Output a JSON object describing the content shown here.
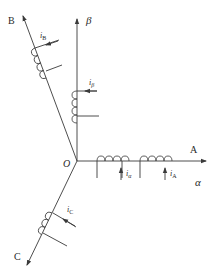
{
  "diagram": {
    "title": "",
    "origin_label": "O",
    "axes": {
      "A": {
        "label": "A"
      },
      "B": {
        "label": "B"
      },
      "C": {
        "label": "C"
      },
      "alpha": {
        "label": "α"
      },
      "beta": {
        "label": "β"
      }
    },
    "currents": {
      "iA": {
        "main": "i",
        "sub": "A"
      },
      "iB": {
        "main": "i",
        "sub": "B"
      },
      "iC": {
        "main": "i",
        "sub": "C"
      },
      "ialpha": {
        "main": "i",
        "sub": "α"
      },
      "ibeta": {
        "main": "i",
        "sub": "β"
      }
    },
    "colors": {
      "line": "#3a3a3a",
      "text": "#2a2a2a",
      "background": "#ffffff"
    }
  }
}
